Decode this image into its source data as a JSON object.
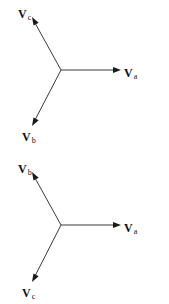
{
  "diagrams": [
    {
      "name": "phasor-diagram-abc",
      "center": [
        61,
        70
      ],
      "vectors": [
        {
          "id": "Va",
          "symbol": "V",
          "subscript": "a",
          "tip": [
            120,
            70
          ],
          "label_pos": [
            124,
            65
          ]
        },
        {
          "id": "Vc",
          "symbol": "V",
          "subscript": "c",
          "tip": [
            32,
            18
          ],
          "label_pos": [
            17,
            6
          ]
        },
        {
          "id": "Vb",
          "symbol": "V",
          "subscript": "b",
          "tip": [
            32,
            125
          ],
          "label_pos": [
            22,
            128
          ]
        }
      ]
    },
    {
      "name": "phasor-diagram-acb",
      "center": [
        61,
        225
      ],
      "vectors": [
        {
          "id": "Va",
          "symbol": "V",
          "subscript": "a",
          "tip": [
            120,
            225
          ],
          "label_pos": [
            124,
            220
          ]
        },
        {
          "id": "Vb",
          "symbol": "V",
          "subscript": "b",
          "tip": [
            32,
            173
          ],
          "label_pos": [
            17,
            161
          ]
        },
        {
          "id": "Vc",
          "symbol": "V",
          "subscript": "c",
          "tip": [
            32,
            281
          ],
          "label_pos": [
            22,
            284
          ]
        }
      ]
    }
  ],
  "colors": {
    "line": "#3a3a3a",
    "arrowhead": "#1a1a1a",
    "text": "#111111",
    "background": "#ffffff"
  },
  "labels": {
    "top": {
      "va": {
        "main": "V",
        "sub": "a"
      },
      "vb": {
        "main": "V",
        "sub": "b"
      },
      "vc": {
        "main": "V",
        "sub": "c"
      }
    },
    "bottom": {
      "va": {
        "main": "V",
        "sub": "a"
      },
      "vb": {
        "main": "V",
        "sub": "b"
      },
      "vc": {
        "main": "V",
        "sub": "c"
      }
    }
  }
}
